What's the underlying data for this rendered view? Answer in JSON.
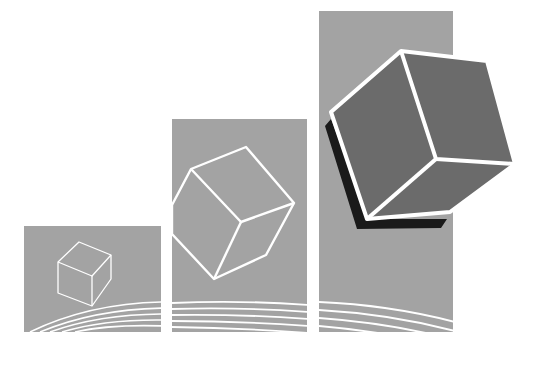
{
  "illustration": {
    "description": "Three ascending gray panels with isometric cubes of increasing size",
    "colors": {
      "background": "#ffffff",
      "panel": "#a3a3a3",
      "line": "#ffffff",
      "cube_face": "#6b6b6b",
      "cube_shadow": "#1a1a1a"
    },
    "panels": [
      {
        "name": "small",
        "x": 24,
        "y": 226,
        "w": 137,
        "h": 106
      },
      {
        "name": "medium",
        "x": 172,
        "y": 119,
        "w": 135,
        "h": 213
      },
      {
        "name": "large",
        "x": 319,
        "y": 11,
        "w": 134,
        "h": 321
      }
    ]
  }
}
